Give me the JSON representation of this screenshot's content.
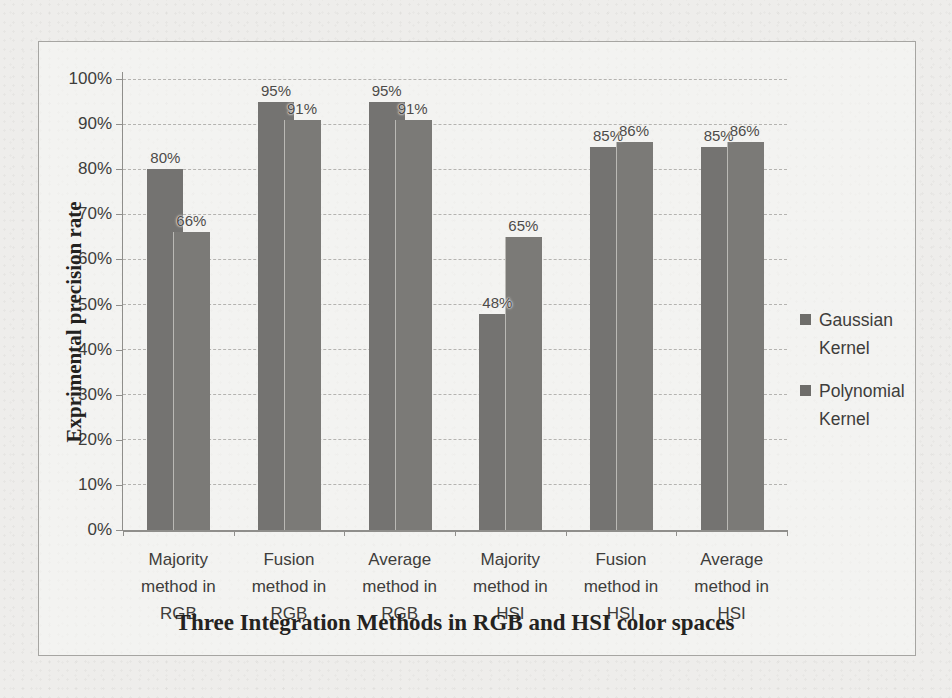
{
  "figure": {
    "paper_color": "#eeedeb",
    "frame_border_color": "#a6a5a2",
    "gridline_color": "#b4b3b0",
    "axis_color": "#8f8e8b",
    "text_color": "#3e3d3b"
  },
  "chart_data": {
    "type": "bar",
    "xlabel": "Three Integration Methods in RGB and HSI color spaces",
    "ylabel": "Exprimental precision rate",
    "categories": [
      [
        "Majority",
        "method in",
        "RGB"
      ],
      [
        "Fusion",
        "method in",
        "RGB"
      ],
      [
        "Average",
        "method in",
        "RGB"
      ],
      [
        "Majority",
        "method in",
        "HSI"
      ],
      [
        "Fusion",
        "method in",
        "HSI"
      ],
      [
        "Average",
        "method in",
        "HSI"
      ]
    ],
    "series": [
      {
        "name": "Gaussian Kernel",
        "legend_lines": [
          "Gaussian",
          "Kernel"
        ],
        "color": "#747371",
        "values": [
          80,
          95,
          95,
          48,
          85,
          85
        ],
        "data_labels": [
          "80%",
          "95%",
          "95%",
          "48%",
          "85%",
          "85%"
        ]
      },
      {
        "name": "Polynomial Kernel",
        "legend_lines": [
          "Polynomial",
          "Kernel"
        ],
        "color": "#7b7a77",
        "values": [
          66,
          91,
          91,
          65,
          86,
          86
        ],
        "data_labels": [
          "66%",
          "91%",
          "91%",
          "65%",
          "86%",
          "86%"
        ]
      }
    ],
    "y_ticks": [
      "0%",
      "10%",
      "20%",
      "30%",
      "40%",
      "50%",
      "60%",
      "70%",
      "80%",
      "90%",
      "100%"
    ],
    "ylim": [
      0,
      100
    ],
    "grid": "horizontal-dashed",
    "legend_position": "right",
    "legend_marker_color": "#6e6d6a"
  }
}
